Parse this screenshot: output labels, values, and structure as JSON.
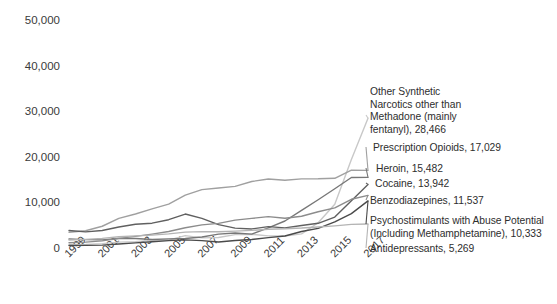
{
  "chart_data": {
    "type": "line",
    "title": "",
    "xlabel": "",
    "ylabel": "",
    "xlim": [
      1999,
      2017
    ],
    "ylim": [
      0,
      50000
    ],
    "ytick_values": [
      0,
      10000,
      20000,
      30000,
      40000,
      50000
    ],
    "ytick_labels": [
      "0",
      "10,000",
      "20,000",
      "30,000",
      "40,000",
      "50,000"
    ],
    "xtick_labels": [
      "1999",
      "2001",
      "2003",
      "2005",
      "2007",
      "2009",
      "2011",
      "2013",
      "2015",
      "2017"
    ],
    "x": [
      1999,
      2000,
      2001,
      2002,
      2003,
      2004,
      2005,
      2006,
      2007,
      2008,
      2009,
      2010,
      2011,
      2012,
      2013,
      2014,
      2015,
      2016,
      2017
    ],
    "grid": false,
    "legend_position": "right-endpoint-labels",
    "series": [
      {
        "name": "Other Synthetic Narcotics other than Methadone (mainly fentanyl)",
        "color": "#c8c8c8",
        "end_value": 28466,
        "values": [
          730,
          782,
          957,
          1295,
          1400,
          1664,
          1742,
          2707,
          2213,
          2306,
          2946,
          3007,
          2666,
          2628,
          3105,
          5544,
          9580,
          19413,
          28466
        ]
      },
      {
        "name": "Prescription Opioids",
        "color": "#a0a0a0",
        "end_value": 17029,
        "values": [
          3442,
          3785,
          4770,
          6482,
          7461,
          8577,
          9612,
          11589,
          12796,
          13149,
          13523,
          14583,
          15140,
          14865,
          15154,
          15172,
          15281,
          17087,
          17029
        ]
      },
      {
        "name": "Heroin",
        "color": "#777777",
        "end_value": 15482,
        "values": [
          1960,
          1842,
          1779,
          2089,
          2080,
          1878,
          2009,
          2088,
          2399,
          3041,
          3278,
          3036,
          4397,
          5925,
          8257,
          10574,
          12989,
          15469,
          15482
        ]
      },
      {
        "name": "Cocaine",
        "color": "#606060",
        "end_value": 13942,
        "values": [
          3822,
          3544,
          3833,
          4599,
          5196,
          5443,
          6208,
          7448,
          6512,
          5129,
          4350,
          4183,
          4681,
          4404,
          4944,
          5415,
          6784,
          10375,
          13942
        ]
      },
      {
        "name": "Benzodiazepines",
        "color": "#8c8c8c",
        "end_value": 11537,
        "values": [
          1135,
          1298,
          1570,
          2107,
          2554,
          3045,
          3616,
          4434,
          5080,
          5395,
          6107,
          6497,
          6872,
          6524,
          6973,
          7945,
          8791,
          10684,
          11537
        ]
      },
      {
        "name": "Psychostimulants with Abuse Potential (Including Methamphetamine)",
        "color": "#4a4a4a",
        "end_value": 10333,
        "values": [
          547,
          573,
          631,
          861,
          1114,
          1371,
          1608,
          1791,
          1623,
          1304,
          1632,
          1854,
          2266,
          2635,
          3627,
          4298,
          5716,
          7542,
          10333
        ]
      },
      {
        "name": "Antidepressants",
        "color": "#b4b4b4",
        "end_value": 5269,
        "values": [
          1749,
          1898,
          2101,
          2464,
          2650,
          2834,
          3093,
          3483,
          3595,
          3560,
          3702,
          3871,
          4105,
          4225,
          4371,
          4596,
          4850,
          5177,
          5269
        ]
      }
    ],
    "endpoint_labels": [
      {
        "id": "label-other-synthetic-narcotics",
        "text": "Other Synthetic\nNarcotics other than\nMethadone (mainly\nfentanyl), 28,466",
        "top": 86,
        "left": 2
      },
      {
        "id": "label-prescription-opioids",
        "text": "Prescription Opioids, 17,029",
        "top": 142,
        "left": 5
      },
      {
        "id": "label-heroin",
        "text": "Heroin, 15,482",
        "top": 163,
        "left": 8
      },
      {
        "id": "label-cocaine",
        "text": "Cocaine, 13,942",
        "top": 178,
        "left": 7
      },
      {
        "id": "label-benzodiazepines",
        "text": "Benzodiazepines, 11,537",
        "top": 195,
        "left": 2
      },
      {
        "id": "label-psychostimulants",
        "text": "Psychostimulants with Abuse Potential\n(Including Methamphetamine), 10,333",
        "top": 215,
        "left": 2
      },
      {
        "id": "label-antidepressants",
        "text": "Antidepressants, 5,269",
        "top": 243,
        "left": 2
      }
    ]
  }
}
